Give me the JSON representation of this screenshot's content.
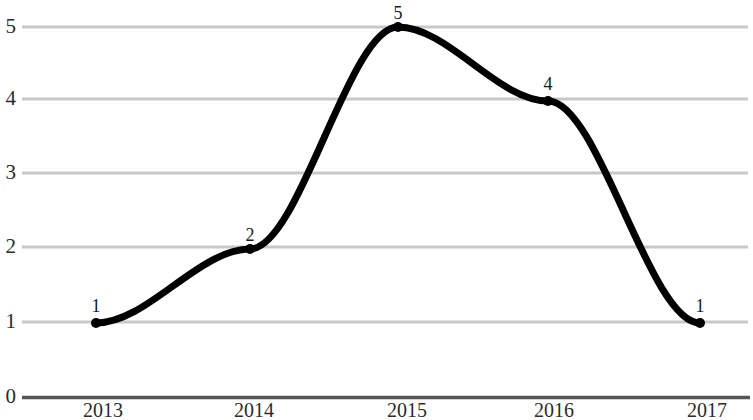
{
  "chart_data": {
    "type": "line",
    "title": "",
    "subtitle": "",
    "xlabel": "",
    "ylabel": "",
    "x": [
      "2013",
      "2014",
      "2015",
      "2016",
      "2017"
    ],
    "categories": [
      "2013",
      "2014",
      "2015",
      "2016",
      "2017"
    ],
    "values": [
      1,
      2,
      5,
      4,
      1
    ],
    "series": [
      {
        "name": "",
        "values": [
          1,
          2,
          5,
          4,
          1
        ],
        "color": "#000000",
        "line_width": 7,
        "interpolation": "smooth-monotone-spline",
        "markers": true,
        "marker_color": "#000000"
      }
    ],
    "point_labels": [
      "1",
      "2",
      "5",
      "4",
      "1"
    ],
    "x_tick_labels": [
      "2013",
      "2014",
      "2015",
      "2016",
      "2017"
    ],
    "y_tick_labels": [
      "0",
      "1",
      "2",
      "3",
      "4",
      "5"
    ],
    "y_tick_values": [
      0,
      1,
      2,
      3,
      4,
      5
    ],
    "ylim": [
      0,
      5
    ],
    "xlim": [
      "2013",
      "2017"
    ],
    "grid": true,
    "grid_orientation": "horizontal",
    "grid_color": "#c8c8c8",
    "axis_line_color": "#555555",
    "legend": null,
    "legend_position": "none",
    "background_color": "#ffffff"
  },
  "geometry": {
    "y_pixels": {
      "0": 397,
      "1": 322,
      "2": 247,
      "3": 173,
      "4": 99,
      "5": 27
    },
    "x_pixels": {
      "2013": 96,
      "2014": 250,
      "2015": 398,
      "2016": 548,
      "2017": 700
    },
    "grid_x_start": 22,
    "grid_x_end": 748
  }
}
